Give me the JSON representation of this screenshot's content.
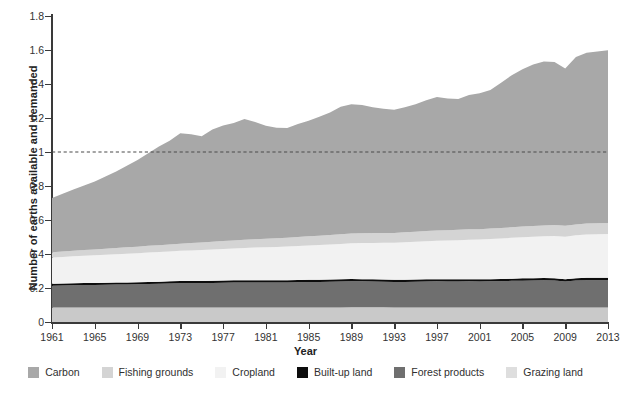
{
  "chart_data": {
    "type": "area",
    "stacked": true,
    "title": "",
    "xlabel": "Year",
    "ylabel": "Number of earths available and demanded",
    "xlim": [
      1961,
      2013
    ],
    "ylim": [
      0,
      1.8
    ],
    "ytick_labels": [
      "0",
      "0.2",
      "0.4",
      "0.6",
      "0.8",
      "1",
      "1.2",
      "1.4",
      "1.6",
      "1.8"
    ],
    "ytick_values": [
      0,
      0.2,
      0.4,
      0.6,
      0.8,
      1.0,
      1.2,
      1.4,
      1.6,
      1.8
    ],
    "xtick_labels": [
      "1961",
      "1965",
      "1969",
      "1973",
      "1977",
      "1981",
      "1985",
      "1989",
      "1993",
      "1997",
      "2001",
      "2005",
      "2009",
      "2013"
    ],
    "xtick_values": [
      1961,
      1965,
      1969,
      1973,
      1977,
      1981,
      1985,
      1989,
      1993,
      1997,
      2001,
      2005,
      2009,
      2013
    ],
    "grid": false,
    "legend_position": "bottom",
    "reference_line": {
      "value": 1.0,
      "style": "dashed",
      "color": "#4a4a4a"
    },
    "x": [
      1961,
      1962,
      1963,
      1964,
      1965,
      1966,
      1967,
      1968,
      1969,
      1970,
      1971,
      1972,
      1973,
      1974,
      1975,
      1976,
      1977,
      1978,
      1979,
      1980,
      1981,
      1982,
      1983,
      1984,
      1985,
      1986,
      1987,
      1988,
      1989,
      1990,
      1991,
      1992,
      1993,
      1994,
      1995,
      1996,
      1997,
      1998,
      1999,
      2000,
      2001,
      2002,
      2003,
      2004,
      2005,
      2006,
      2007,
      2008,
      2009,
      2010,
      2011,
      2012,
      2013
    ],
    "stack_order_bottom_to_top": [
      "Grazing land",
      "Forest products",
      "Built-up land",
      "Cropland",
      "Fishing grounds",
      "Carbon"
    ],
    "series": [
      {
        "name": "Grazing land",
        "color": "#c9c9c9",
        "values": [
          0.085,
          0.085,
          0.086,
          0.086,
          0.086,
          0.086,
          0.086,
          0.086,
          0.086,
          0.086,
          0.086,
          0.086,
          0.086,
          0.086,
          0.086,
          0.086,
          0.086,
          0.086,
          0.086,
          0.086,
          0.086,
          0.086,
          0.086,
          0.086,
          0.086,
          0.086,
          0.086,
          0.086,
          0.087,
          0.087,
          0.087,
          0.087,
          0.086,
          0.086,
          0.086,
          0.086,
          0.086,
          0.086,
          0.086,
          0.086,
          0.086,
          0.086,
          0.086,
          0.086,
          0.086,
          0.086,
          0.086,
          0.086,
          0.086,
          0.086,
          0.086,
          0.086,
          0.086
        ]
      },
      {
        "name": "Forest products",
        "color": "#6f6f6f",
        "values": [
          0.128,
          0.129,
          0.13,
          0.131,
          0.132,
          0.133,
          0.134,
          0.135,
          0.136,
          0.138,
          0.139,
          0.14,
          0.142,
          0.142,
          0.142,
          0.144,
          0.145,
          0.146,
          0.147,
          0.147,
          0.146,
          0.146,
          0.147,
          0.148,
          0.149,
          0.15,
          0.151,
          0.152,
          0.153,
          0.152,
          0.151,
          0.15,
          0.149,
          0.15,
          0.151,
          0.152,
          0.153,
          0.152,
          0.152,
          0.153,
          0.152,
          0.153,
          0.154,
          0.156,
          0.157,
          0.158,
          0.159,
          0.158,
          0.152,
          0.158,
          0.16,
          0.16,
          0.16
        ]
      },
      {
        "name": "Built-up land",
        "color": "#0d0d0d",
        "values": [
          0.012,
          0.012,
          0.012,
          0.012,
          0.012,
          0.012,
          0.012,
          0.012,
          0.012,
          0.012,
          0.012,
          0.013,
          0.013,
          0.013,
          0.013,
          0.013,
          0.013,
          0.013,
          0.013,
          0.013,
          0.013,
          0.013,
          0.013,
          0.013,
          0.013,
          0.013,
          0.013,
          0.013,
          0.013,
          0.013,
          0.013,
          0.013,
          0.013,
          0.013,
          0.013,
          0.013,
          0.013,
          0.013,
          0.013,
          0.013,
          0.013,
          0.013,
          0.013,
          0.013,
          0.014,
          0.014,
          0.014,
          0.014,
          0.014,
          0.014,
          0.014,
          0.014,
          0.014
        ]
      },
      {
        "name": "Cropland",
        "color": "#f2f2f2",
        "values": [
          0.155,
          0.157,
          0.159,
          0.161,
          0.163,
          0.165,
          0.167,
          0.169,
          0.171,
          0.173,
          0.175,
          0.176,
          0.178,
          0.18,
          0.182,
          0.184,
          0.186,
          0.188,
          0.19,
          0.192,
          0.194,
          0.196,
          0.198,
          0.2,
          0.202,
          0.204,
          0.206,
          0.208,
          0.21,
          0.212,
          0.214,
          0.216,
          0.218,
          0.22,
          0.222,
          0.224,
          0.226,
          0.228,
          0.23,
          0.232,
          0.234,
          0.236,
          0.238,
          0.24,
          0.242,
          0.244,
          0.246,
          0.248,
          0.25,
          0.252,
          0.254,
          0.256,
          0.258
        ]
      },
      {
        "name": "Fishing grounds",
        "color": "#d4d4d4",
        "values": [
          0.03,
          0.031,
          0.032,
          0.033,
          0.034,
          0.035,
          0.036,
          0.037,
          0.038,
          0.039,
          0.04,
          0.041,
          0.042,
          0.043,
          0.044,
          0.045,
          0.046,
          0.047,
          0.048,
          0.049,
          0.05,
          0.051,
          0.052,
          0.053,
          0.054,
          0.055,
          0.056,
          0.057,
          0.058,
          0.058,
          0.058,
          0.058,
          0.058,
          0.059,
          0.059,
          0.06,
          0.06,
          0.06,
          0.061,
          0.061,
          0.061,
          0.062,
          0.062,
          0.062,
          0.063,
          0.063,
          0.063,
          0.064,
          0.064,
          0.064,
          0.065,
          0.065,
          0.065
        ]
      },
      {
        "name": "Carbon",
        "color": "#a8a8a8",
        "values": [
          0.32,
          0.34,
          0.36,
          0.38,
          0.4,
          0.425,
          0.45,
          0.48,
          0.51,
          0.545,
          0.58,
          0.61,
          0.65,
          0.64,
          0.625,
          0.66,
          0.68,
          0.69,
          0.71,
          0.69,
          0.665,
          0.65,
          0.645,
          0.665,
          0.68,
          0.7,
          0.72,
          0.75,
          0.76,
          0.755,
          0.74,
          0.73,
          0.725,
          0.735,
          0.75,
          0.77,
          0.785,
          0.775,
          0.77,
          0.79,
          0.8,
          0.815,
          0.855,
          0.895,
          0.925,
          0.95,
          0.965,
          0.96,
          0.925,
          0.985,
          1.005,
          1.01,
          1.015
        ]
      }
    ],
    "totals": [
      0.73,
      0.754,
      0.779,
      0.803,
      0.827,
      0.856,
      0.885,
      0.919,
      0.953,
      0.993,
      1.032,
      1.066,
      1.111,
      1.104,
      1.092,
      1.132,
      1.156,
      1.17,
      1.194,
      1.177,
      1.154,
      1.142,
      1.141,
      1.165,
      1.184,
      1.207,
      1.233,
      1.267,
      1.281,
      1.277,
      1.263,
      1.254,
      1.249,
      1.263,
      1.281,
      1.305,
      1.323,
      1.316,
      1.312,
      1.335,
      1.346,
      1.365,
      1.408,
      1.452,
      1.487,
      1.515,
      1.533,
      1.53,
      1.491,
      1.559,
      1.584,
      1.591,
      1.598
    ]
  },
  "legend": {
    "items": [
      {
        "label": "Carbon",
        "color": "#a8a8a8"
      },
      {
        "label": "Fishing grounds",
        "color": "#d4d4d4"
      },
      {
        "label": "Cropland",
        "color": "#f2f2f2"
      },
      {
        "label": "Built-up land",
        "color": "#0d0d0d"
      },
      {
        "label": "Forest products",
        "color": "#6f6f6f"
      },
      {
        "label": "Grazing land",
        "color": "#dedede"
      }
    ]
  }
}
